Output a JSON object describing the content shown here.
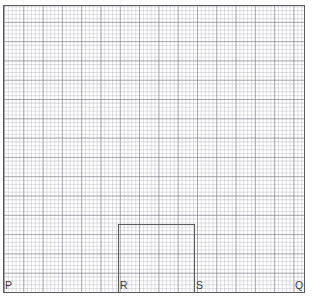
{
  "figure": {
    "type": "geometry-diagram",
    "background_color": "#ffffff",
    "stroke_color": "#595959",
    "grid": {
      "fine_spacing_px": 3.86,
      "major_spacing_px": 19.3,
      "fine_color": "#96969f",
      "major_color": "#78787f"
    },
    "outer_square": {
      "name": "PQ-square",
      "x": 3,
      "y": 5,
      "width": 302,
      "height": 288
    },
    "inner_rectangle": {
      "name": "RS-rectangle",
      "x": 118,
      "y": 224,
      "width": 77,
      "height": 69
    },
    "labels": [
      {
        "id": "P",
        "text": "P",
        "position": "bottom-left-outer"
      },
      {
        "id": "R",
        "text": "R",
        "position": "bottom-inner-left"
      },
      {
        "id": "S",
        "text": "S",
        "position": "bottom-inner-right"
      },
      {
        "id": "Q",
        "text": "Q",
        "position": "bottom-right-outer"
      }
    ]
  }
}
